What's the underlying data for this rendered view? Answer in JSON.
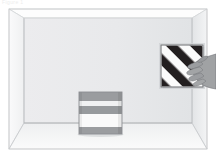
{
  "scene": {
    "title": "3D interior room scene",
    "watermark_text": "Figure 1",
    "canvas": {
      "width": 216,
      "height": 158
    },
    "background_color": "#ffffff"
  },
  "room": {
    "name": "perspective-room",
    "frame": {
      "left": 9,
      "top": 9,
      "right": 207,
      "bottom": 149,
      "outline_color": "#c9cbcd"
    },
    "back_wall": {
      "label": "back-wall",
      "x": 24,
      "y": 18,
      "width": 168,
      "height": 105,
      "color": "#e9eaec",
      "edge_color": "#c4c6c9"
    },
    "left_wall": {
      "label": "left-wall",
      "color": "#f2f3f4",
      "points": "9,9 24,18 24,123 9,149"
    },
    "right_wall": {
      "label": "right-wall",
      "color": "#e3e5e7",
      "points": "207,9 192,18 192,123 207,149"
    },
    "ceiling": {
      "label": "ceiling",
      "color": "#fcfcfc",
      "points": "9,9 207,9 192,18 24,18"
    },
    "floor": {
      "label": "floor",
      "color": "#f6f7f8",
      "points": "24,123 192,123 207,149 9,149"
    },
    "floor_line_y": 123,
    "corner_lines_color": "#bcbec1"
  },
  "objects": {
    "striped_box": {
      "name": "striped-box-on-floor",
      "description": "horizontally banded cube resting on the floor",
      "x": 79,
      "y": 92,
      "width": 43,
      "height": 42,
      "border_color": "#8d8f92",
      "bands": [
        {
          "label": "band-top-dark",
          "offset": 0,
          "height": 9,
          "color": "#9a9c9f"
        },
        {
          "label": "band-light-1",
          "offset": 9,
          "height": 5,
          "color": "#f0f1f2"
        },
        {
          "label": "band-mid-dark",
          "offset": 14,
          "height": 8,
          "color": "#979a9d"
        },
        {
          "label": "band-light-2",
          "offset": 22,
          "height": 13,
          "color": "#fafafa"
        },
        {
          "label": "band-bottom-dark",
          "offset": 35,
          "height": 7,
          "color": "#9b9da0"
        }
      ],
      "shadow": {
        "label": "box-shadow",
        "color": "#d9dadc"
      }
    },
    "striped_panel": {
      "name": "striped-panel-on-right-wall",
      "description": "square panel with diagonal black and white stripes, held against the right wall",
      "x": 161,
      "y": 45,
      "width": 42,
      "height": 42,
      "border_color": "#77797c",
      "stripe_angle_deg": 45,
      "stripe_dark_color": "#231f20",
      "stripe_light_color": "#fbfbfb",
      "stripe_width": 6,
      "stripe_count": 10
    },
    "hand": {
      "name": "hand-holding-panel",
      "description": "a hand reaching in from the right edge, fingers overlapping the panel",
      "x": 190,
      "y": 54,
      "width": 26,
      "height": 34,
      "skin_color": "#9c9ea0",
      "outline_color": "#6f7174",
      "finger_count": 5
    }
  },
  "annotations": {
    "objects_count": 2,
    "light_source": "diffuse"
  }
}
